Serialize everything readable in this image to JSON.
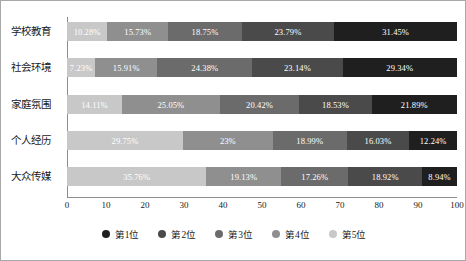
{
  "chart_data": {
    "type": "bar",
    "subtype": "stacked-horizontal-100",
    "title": "",
    "xlabel": "",
    "ylabel": "",
    "xlim": [
      0,
      100
    ],
    "xticks": [
      0,
      10,
      20,
      30,
      40,
      50,
      60,
      70,
      80,
      90,
      100
    ],
    "grid": false,
    "legend_position": "bottom",
    "categories": [
      "学校教育",
      "社会环境",
      "家庭氛围",
      "个人经历",
      "大众传媒"
    ],
    "series": [
      {
        "name": "第1位",
        "color": "#1f1f1f",
        "values": [
          31.45,
          29.34,
          21.89,
          12.24,
          8.94
        ],
        "labels": [
          "31.45%",
          "29.34%",
          "21.89%",
          "12.24%",
          "8.94%"
        ]
      },
      {
        "name": "第2位",
        "color": "#4a4a4a",
        "values": [
          23.79,
          23.14,
          18.53,
          16.03,
          18.92
        ],
        "labels": [
          "23.79%",
          "23.14%",
          "18.53%",
          "16.03%",
          "18.92%"
        ]
      },
      {
        "name": "第3位",
        "color": "#6b6b6b",
        "values": [
          18.75,
          24.38,
          20.42,
          18.99,
          17.26
        ],
        "labels": [
          "18.75%",
          "24.38%",
          "20.42%",
          "18.99%",
          "17.26%"
        ]
      },
      {
        "name": "第4位",
        "color": "#8f8f8f",
        "values": [
          15.73,
          15.91,
          25.05,
          23.0,
          19.13
        ],
        "labels": [
          "15.73%",
          "15.91%",
          "25.05%",
          "23%",
          "19.13%"
        ]
      },
      {
        "name": "第5位",
        "color": "#c8c8c8",
        "values": [
          10.28,
          7.23,
          14.11,
          29.75,
          35.76
        ],
        "labels": [
          "10.28%",
          "7.23%",
          "14.11%",
          "29.75%",
          "35.76%"
        ]
      }
    ],
    "stack_order_left_to_right": [
      "第5位",
      "第4位",
      "第3位",
      "第2位",
      "第1位"
    ]
  },
  "legend": {
    "items": [
      {
        "label": "第1位",
        "color": "#1f1f1f"
      },
      {
        "label": "第2位",
        "color": "#4a4a4a"
      },
      {
        "label": "第3位",
        "color": "#6b6b6b"
      },
      {
        "label": "第4位",
        "color": "#8f8f8f"
      },
      {
        "label": "第5位",
        "color": "#c8c8c8"
      }
    ]
  }
}
